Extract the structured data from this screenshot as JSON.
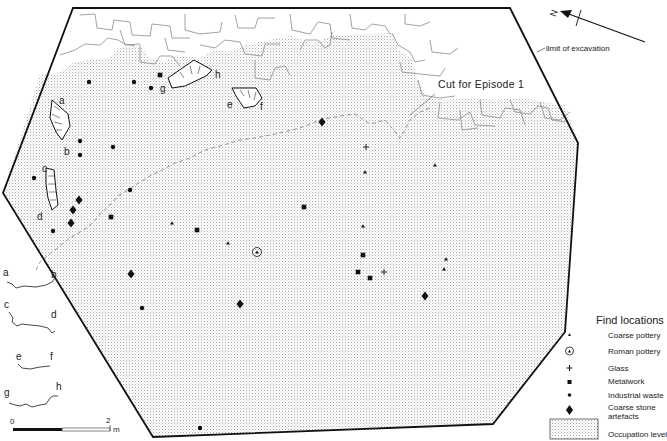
{
  "figure": {
    "type": "archaeological site plan",
    "north_label": "N",
    "annotations": {
      "limit_of_excavation": "limit of excavation",
      "cut_for_episode": "Cut for Episode 1"
    },
    "feature_labels": [
      "a",
      "b",
      "c",
      "d",
      "e",
      "f",
      "g",
      "h"
    ],
    "sections": [
      {
        "start": "a",
        "end": "b"
      },
      {
        "start": "c",
        "end": "d"
      },
      {
        "start": "e",
        "end": "f"
      },
      {
        "start": "g",
        "end": "h"
      }
    ],
    "scale_bar": {
      "start_label": "0",
      "end_label": "2",
      "unit": "m"
    }
  },
  "legend": {
    "title": "Find locations",
    "items": [
      {
        "key": "coarse_pottery",
        "label": "Coarse pottery",
        "symbol": "triangle-icon"
      },
      {
        "key": "roman_pottery",
        "label": "Roman pottery",
        "symbol": "circled-triangle-icon"
      },
      {
        "key": "glass",
        "label": "Glass",
        "symbol": "plus-icon"
      },
      {
        "key": "metalwork",
        "label": "Metalwork",
        "symbol": "square-icon"
      },
      {
        "key": "industrial_waste",
        "label": "Industrial waste",
        "symbol": "dot-icon"
      },
      {
        "key": "coarse_stone",
        "label": "Coarse stone artefacts",
        "label_line1": "Coarse stone",
        "label_line2": "artefacts",
        "symbol": "diamond-icon"
      },
      {
        "key": "occupation",
        "label": "Occupation level",
        "symbol": "stipple-box-icon"
      }
    ]
  },
  "finds_counts": {
    "industrial_waste": 11,
    "metalwork": 7,
    "coarse_pottery": 7,
    "roman_pottery": 1,
    "glass": 2,
    "coarse_stone": 7
  },
  "colors": {
    "ink": "#111111",
    "stipple": "#9a9a9a",
    "wall_line": "#8a8a8a",
    "background": "#ffffff"
  }
}
